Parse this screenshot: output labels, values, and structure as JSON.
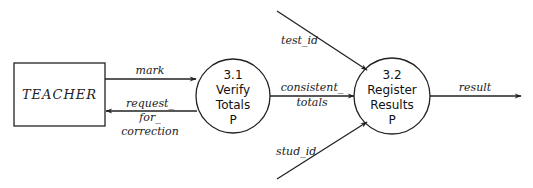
{
  "diagram": {
    "type": "data-flow-diagram",
    "colors": {
      "line": "#222222",
      "background": "#ffffff"
    },
    "entities": [
      {
        "id": "teacher",
        "label": "TEACHER"
      }
    ],
    "processes": [
      {
        "id": "p31",
        "number": "3.1",
        "name_line1": "Verify",
        "name_line2": "Totals",
        "marker": "P"
      },
      {
        "id": "p32",
        "number": "3.2",
        "name_line1": "Register",
        "name_line2": "Results",
        "marker": "P"
      }
    ],
    "flows": {
      "mark": {
        "label": "mark",
        "from": "TEACHER",
        "to": "3.1"
      },
      "request": {
        "line1": "request_",
        "line2": "for_",
        "line3": "correction",
        "from": "3.1",
        "to": "TEACHER"
      },
      "consistent": {
        "line1": "consistent_",
        "line2": "totals",
        "from": "3.1",
        "to": "3.2"
      },
      "test_id": {
        "label": "test_id",
        "to": "3.2"
      },
      "stud_id": {
        "label": "stud_id",
        "to": "3.2"
      },
      "result": {
        "label": "result",
        "from": "3.2"
      }
    }
  }
}
